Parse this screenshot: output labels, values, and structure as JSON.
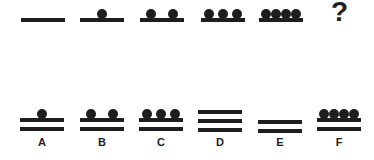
{
  "puzzle": {
    "sequence": [
      {
        "bars": 1,
        "dots": 0
      },
      {
        "bars": 1,
        "dots": 1
      },
      {
        "bars": 1,
        "dots": 2
      },
      {
        "bars": 1,
        "dots": 3
      },
      {
        "bars": 1,
        "dots": 4
      }
    ],
    "unknown_label": "?",
    "options": [
      {
        "label": "A",
        "bars": 2,
        "dots": 1
      },
      {
        "label": "B",
        "bars": 2,
        "dots": 2
      },
      {
        "label": "C",
        "bars": 2,
        "dots": 3
      },
      {
        "label": "D",
        "bars": 3,
        "dots": 0
      },
      {
        "label": "E",
        "bars": 2,
        "dots": 0
      },
      {
        "label": "F",
        "bars": 2,
        "dots": 4
      }
    ],
    "ink_color": "#1e1e1e"
  }
}
